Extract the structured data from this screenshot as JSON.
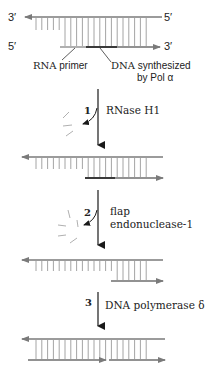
{
  "colors": {
    "template_strand": "#7a7a7a",
    "rna_primer": "#a8a8a8",
    "dna_pol_alpha": "#3a3a3a",
    "new_dna": "#6e6e6e",
    "rung": "#9a9a9a",
    "arrow": "#1a1a1a",
    "debris": "#b0b0b0",
    "text": "#222222"
  },
  "stage0": {
    "top_left_end": "3′",
    "top_right_end": "5′",
    "bottom_left_end": "5′",
    "bottom_right_end": "3′",
    "label_rna_primer": "RNA primer",
    "label_rna_primer_bold": "RNA",
    "label_rna_primer_rest": " primer",
    "label_dna_synth_line1": "DNA synthesized",
    "label_dna_synth_line2": "by Pol α"
  },
  "steps": [
    {
      "number": "1",
      "enzyme": "RNase H1",
      "enzyme_line2": ""
    },
    {
      "number": "2",
      "enzyme": "flap",
      "enzyme_line2": "endonuclease-1"
    },
    {
      "number": "3",
      "enzyme": "DNA polymerase δ",
      "enzyme_line2": ""
    }
  ]
}
